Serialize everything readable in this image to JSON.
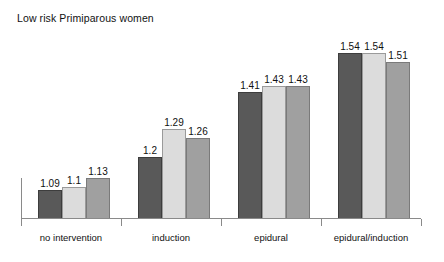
{
  "chart_data": {
    "type": "bar",
    "title": "Low risk Primiparous women",
    "xlabel": "",
    "ylabel": "",
    "grid": false,
    "legend": "none",
    "baseline": 1.0,
    "ylim": [
      1.0,
      1.62
    ],
    "categories": [
      "no intervention",
      "induction",
      "epidural",
      "epidural/induction"
    ],
    "series": [
      {
        "name": "series-1",
        "color": "#595959",
        "values": [
          1.09,
          1.2,
          1.41,
          1.54
        ]
      },
      {
        "name": "series-2",
        "color": "#dcdcdc",
        "values": [
          1.1,
          1.29,
          1.43,
          1.54
        ]
      },
      {
        "name": "series-3",
        "color": "#a0a0a0",
        "values": [
          1.13,
          1.26,
          1.43,
          1.51
        ]
      }
    ],
    "value_labels": [
      [
        "1.09",
        "1.1",
        "1.13"
      ],
      [
        "1.2",
        "1.29",
        "1.26"
      ],
      [
        "1.41",
        "1.43",
        "1.43"
      ],
      [
        "1.54",
        "1.54",
        "1.51"
      ]
    ]
  },
  "axis": {
    "line_color": "#8a8a8a",
    "tick_count": 5
  }
}
